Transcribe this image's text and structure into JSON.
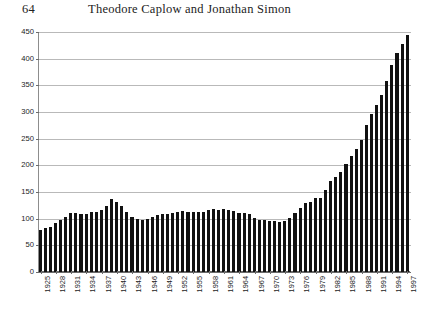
{
  "running_head": {
    "page_number": "64",
    "title": "Theodore Caplow and Jonathan Simon"
  },
  "chart_data": {
    "type": "bar",
    "title": "",
    "subtitle": "",
    "xlabel": "",
    "ylabel": "",
    "grid": true,
    "legend": "none",
    "bar_color": "#111111",
    "gridline_color": "#b9b9b9",
    "axis_color": "#6b6b6b",
    "xlim": [
      1925,
      1997
    ],
    "ylim": [
      0,
      450
    ],
    "ytick_step": 50,
    "ytick_labels": [
      "450",
      "400",
      "350",
      "300",
      "250",
      "200",
      "150",
      "100",
      "50",
      "0"
    ],
    "ytick_values": [
      450,
      400,
      350,
      300,
      250,
      200,
      150,
      100,
      50,
      0
    ],
    "xtick_labels": [
      "1925",
      "1928",
      "1931",
      "1934",
      "1937",
      "1940",
      "1943",
      "1946",
      "1949",
      "1952",
      "1955",
      "1958",
      "1961",
      "1964",
      "1967",
      "1970",
      "1973",
      "1976",
      "1979",
      "1982",
      "1985",
      "1988",
      "1991",
      "1994",
      "1997"
    ],
    "xtick_step": 3,
    "categories": [
      1925,
      1926,
      1927,
      1928,
      1929,
      1930,
      1931,
      1932,
      1933,
      1934,
      1935,
      1936,
      1937,
      1938,
      1939,
      1940,
      1941,
      1942,
      1943,
      1944,
      1945,
      1946,
      1947,
      1948,
      1949,
      1950,
      1951,
      1952,
      1953,
      1954,
      1955,
      1956,
      1957,
      1958,
      1959,
      1960,
      1961,
      1962,
      1963,
      1964,
      1965,
      1966,
      1967,
      1968,
      1969,
      1970,
      1971,
      1972,
      1973,
      1974,
      1975,
      1976,
      1977,
      1978,
      1979,
      1980,
      1981,
      1982,
      1983,
      1984,
      1985,
      1986,
      1987,
      1988,
      1989,
      1990,
      1991,
      1992,
      1993,
      1994,
      1995,
      1996,
      1997
    ],
    "values": [
      79,
      83,
      85,
      91,
      98,
      104,
      110,
      110,
      109,
      109,
      113,
      113,
      117,
      123,
      137,
      131,
      124,
      112,
      103,
      100,
      98,
      99,
      103,
      106,
      109,
      109,
      110,
      112,
      115,
      112,
      112,
      112,
      113,
      117,
      119,
      117,
      119,
      117,
      114,
      111,
      110,
      108,
      102,
      97,
      97,
      96,
      95,
      93,
      96,
      102,
      111,
      120,
      129,
      132,
      138,
      139,
      154,
      171,
      179,
      188,
      202,
      217,
      231,
      247,
      276,
      297,
      313,
      332,
      359,
      389,
      411,
      427,
      445
    ],
    "units_note": "rate per 100,000 population"
  }
}
